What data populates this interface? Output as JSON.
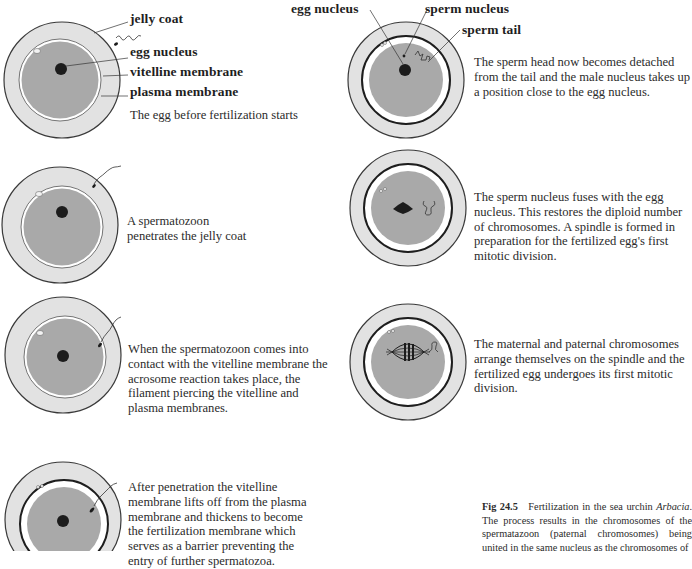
{
  "figure": {
    "number": "Fig 24.5",
    "title": "Fertilization in the sea urchin",
    "organism": "Arbacia",
    "caption_rest": "The process results in the chromosomes of the spermatazoon (paternal chromosomes) being united in the same nucleus as the chromosomes of"
  },
  "labels": {
    "jelly_coat": "jelly coat",
    "egg_nucleus_1": "egg nucleus",
    "vitelline_membrane": "vitelline membrane",
    "plasma_membrane": "plasma membrane",
    "egg_nucleus_2": "egg nucleus",
    "sperm_nucleus": "sperm nucleus",
    "sperm_tail": "sperm tail"
  },
  "colors": {
    "jelly_coat": "#e2e2e2",
    "cytoplasm": "#a9a9a9",
    "outline": "#3a3a3a",
    "nucleus": "#1c1c1c"
  },
  "stages": [
    {
      "id": 1,
      "text": "The egg before fertilization starts"
    },
    {
      "id": 2,
      "text": "A spermatozoon penetrates the jelly coat"
    },
    {
      "id": 3,
      "text": "When the spermatozoon comes into contact with the vitelline membrane the acrosome reaction takes place, the filament piercing the vitelline and plasma membranes."
    },
    {
      "id": 4,
      "text": "After penetration the vitelline membrane lifts off from the plasma membrane and thickens to become the fertilization membrane which serves as a barrier preventing the entry of further spermatozoa."
    },
    {
      "id": 5,
      "text": "The sperm head now becomes detached from the tail and the male nucleus takes up a position close to the egg nucleus."
    },
    {
      "id": 6,
      "text": "The sperm nucleus fuses with the egg nucleus. This restores the diploid number of chromosomes. A spindle is formed in preparation for the fertilized egg's first mitotic division."
    },
    {
      "id": 7,
      "text": "The maternal and paternal chromosomes arrange themselves on the spindle and the fertilized egg undergoes its first mitotic division."
    }
  ]
}
